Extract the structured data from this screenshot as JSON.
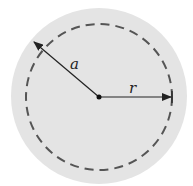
{
  "diagram": {
    "type": "circle-radius-diagram",
    "center": {
      "x": 99,
      "y": 97
    },
    "outer_disk": {
      "radius": 88,
      "fill": "#e4e4e4"
    },
    "dashed_circle": {
      "radius": 73,
      "stroke": "#555555",
      "dash": "9 6"
    },
    "labels": {
      "a": "a",
      "r": "r"
    },
    "arrows": [
      {
        "name": "radius-a",
        "label": "a",
        "from": [
          99,
          97
        ],
        "to": [
          33,
          41
        ]
      },
      {
        "name": "radius-r",
        "label": "r",
        "from": [
          99,
          97
        ],
        "to": [
          172,
          97
        ]
      }
    ],
    "colors": {
      "background": "#ffffff",
      "disk": "#e4e4e4",
      "line": "#222222",
      "dash": "#555555"
    }
  }
}
